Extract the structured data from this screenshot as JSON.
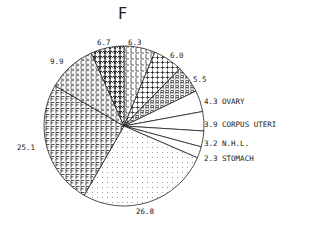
{
  "chart_data": {
    "type": "pie",
    "title": "F",
    "start_angle_deg": -90,
    "direction": "clockwise",
    "center": [
      124,
      126
    ],
    "radius": 80,
    "slices": [
      {
        "value": 6.3,
        "label": "6.3",
        "name": "",
        "pattern": "L",
        "label_pos": [
          128,
          45
        ]
      },
      {
        "value": 6.0,
        "label": "6.0",
        "name": "",
        "pattern": "plus",
        "label_pos": [
          170,
          58
        ]
      },
      {
        "value": 5.5,
        "label": "5.5",
        "name": "",
        "pattern": "R",
        "label_pos": [
          193,
          82
        ]
      },
      {
        "value": 4.3,
        "label": "4.3",
        "name": "OVARY",
        "pattern": "none",
        "label_pos": [
          204,
          104
        ]
      },
      {
        "value": 3.9,
        "label": "3.9",
        "name": "CORPUS UTERI",
        "pattern": "none",
        "label_pos": [
          204,
          127
        ]
      },
      {
        "value": 3.2,
        "label": "3.2",
        "name": "N.H.L.",
        "pattern": "none",
        "label_pos": [
          204,
          146
        ]
      },
      {
        "value": 2.3,
        "label": "2.3",
        "name": "STOMACH",
        "pattern": "none",
        "label_pos": [
          204,
          161
        ]
      },
      {
        "value": 26.8,
        "label": "26.8",
        "name": "",
        "pattern": "dots",
        "label_pos": [
          136,
          214
        ]
      },
      {
        "value": 25.1,
        "label": "25.1",
        "name": "",
        "pattern": "F",
        "label_pos": [
          17,
          150
        ]
      },
      {
        "value": 9.9,
        "label": "9.9",
        "name": "",
        "pattern": "C",
        "label_pos": [
          50,
          64
        ]
      },
      {
        "value": 6.7,
        "label": "6.7",
        "name": "",
        "pattern": "M",
        "label_pos": [
          97,
          45
        ]
      }
    ],
    "legend": "inline labels",
    "grid": false
  }
}
